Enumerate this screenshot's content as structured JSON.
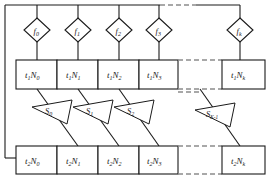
{
  "diagram": {
    "stroke_color": "#1a1a1a",
    "dashed_color": "#8c8c8c",
    "background": "#ffffff",
    "decisions": [
      {
        "name": "f0",
        "base": "f",
        "sub": "0"
      },
      {
        "name": "f1",
        "base": "f",
        "sub": "1"
      },
      {
        "name": "f2",
        "base": "f",
        "sub": "2"
      },
      {
        "name": "f3",
        "base": "f",
        "sub": "3"
      },
      {
        "name": "fk",
        "base": "f",
        "sub": "k"
      }
    ],
    "row1": {
      "prefix": "t",
      "prefix_sub": "1",
      "cells": [
        {
          "name": "t1N0",
          "letter": "N",
          "sub": "0"
        },
        {
          "name": "t1N1",
          "letter": "N",
          "sub": "1"
        },
        {
          "name": "t1N2",
          "letter": "N",
          "sub": "2"
        },
        {
          "name": "t1N3",
          "letter": "N",
          "sub": "3"
        },
        {
          "name": "t1Nk",
          "letter": "N",
          "sub": "k"
        }
      ]
    },
    "row2": {
      "prefix": "t",
      "prefix_sub": "2",
      "cells": [
        {
          "name": "t2N0",
          "letter": "N",
          "sub": "0"
        },
        {
          "name": "t2N1",
          "letter": "N",
          "sub": "1"
        },
        {
          "name": "t2N2",
          "letter": "N",
          "sub": "2"
        },
        {
          "name": "t2N3",
          "letter": "N",
          "sub": "3"
        },
        {
          "name": "t2Nk",
          "letter": "N",
          "sub": "k"
        }
      ]
    },
    "selectors": [
      {
        "name": "S0",
        "base": "S",
        "sub": "0"
      },
      {
        "name": "S1",
        "base": "S",
        "sub": "1"
      },
      {
        "name": "S2",
        "base": "S",
        "sub": "2"
      },
      {
        "name": "SK1",
        "base": "S",
        "sub": "K-1"
      }
    ]
  }
}
